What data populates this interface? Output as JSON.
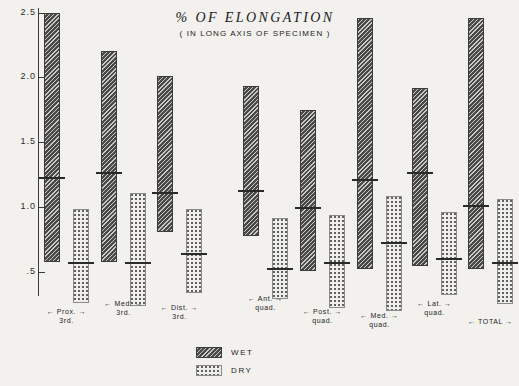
{
  "chart_data": {
    "type": "bar",
    "title": "% OF ELONGATION",
    "subtitle": "( IN LONG AXIS OF SPECIMEN )",
    "xlabel": "",
    "ylabel": "",
    "ylim": [
      0.35,
      2.55
    ],
    "yticks": [
      2.5,
      2.0,
      1.5,
      1.0,
      0.5
    ],
    "ytick_labels": [
      "2.5",
      "2.0",
      "1.5",
      "1.0",
      ".5"
    ],
    "grid": false,
    "legend_position": "bottom-center",
    "categories": [
      "Prox. 3rd.",
      "Med. 3rd.",
      "Dist. 3rd.",
      "Ant. quad.",
      "Post. quad.",
      "Med. quad.",
      "Lat. quad.",
      "TOTAL"
    ],
    "category_lines": [
      [
        "← Prox. →",
        "3rd."
      ],
      [
        "← Med. →",
        "3rd."
      ],
      [
        "← Dist. →",
        "3rd."
      ],
      [
        "← Ant. →",
        "quad."
      ],
      [
        "← Post. →",
        "quad."
      ],
      [
        "← Med. →",
        "quad."
      ],
      [
        "← Lat. →",
        "quad."
      ],
      [
        "← TOTAL →",
        ""
      ]
    ],
    "series": [
      {
        "name": "WET",
        "style": "hatched-dark",
        "color": "#4a4a48",
        "ranges": [
          {
            "min": 0.58,
            "max": 2.5,
            "mean": 1.23
          },
          {
            "min": 0.58,
            "max": 2.21,
            "mean": 1.27
          },
          {
            "min": 0.81,
            "max": 2.01,
            "mean": 1.12
          },
          {
            "min": 0.78,
            "max": 1.94,
            "mean": 1.13
          },
          {
            "min": 0.51,
            "max": 1.75,
            "mean": 1.0
          },
          {
            "min": 0.52,
            "max": 2.46,
            "mean": 1.22
          },
          {
            "min": 0.55,
            "max": 1.92,
            "mean": 1.27
          },
          {
            "min": 0.52,
            "max": 2.46,
            "mean": 1.02
          }
        ]
      },
      {
        "name": "DRY",
        "style": "dotted-light",
        "color": "#efeeea",
        "ranges": [
          {
            "min": 0.26,
            "max": 0.99,
            "mean": 0.58
          },
          {
            "min": 0.24,
            "max": 1.11,
            "mean": 0.58
          },
          {
            "min": 0.34,
            "max": 0.99,
            "mean": 0.65
          },
          {
            "min": 0.29,
            "max": 0.92,
            "mean": 0.53
          },
          {
            "min": 0.22,
            "max": 0.94,
            "mean": 0.58
          },
          {
            "min": 0.2,
            "max": 1.09,
            "mean": 0.73
          },
          {
            "min": 0.32,
            "max": 0.96,
            "mean": 0.61
          },
          {
            "min": 0.25,
            "max": 1.06,
            "mean": 0.58
          }
        ]
      }
    ],
    "legend": [
      {
        "label": "WET",
        "style": "hatched-dark"
      },
      {
        "label": "DRY",
        "style": "dotted-light"
      }
    ]
  },
  "layout": {
    "axis": {
      "x": 38,
      "top": 8,
      "height": 288
    },
    "y_pixels": {
      "v2_5": 13,
      "v0_5": 272
    },
    "bar_width": 16,
    "group_x": [
      44,
      101,
      157,
      243,
      300,
      357,
      412,
      468
    ],
    "pair_gap": 29,
    "label_y": [
      307,
      299,
      303,
      294,
      307,
      311,
      299,
      317
    ]
  }
}
